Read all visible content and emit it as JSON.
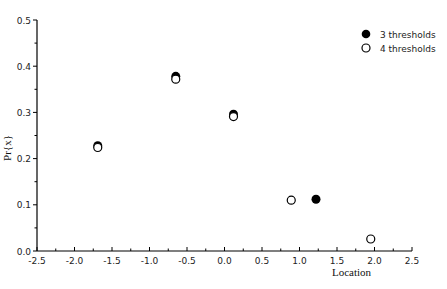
{
  "chart_data": {
    "type": "scatter",
    "title": "",
    "xlabel": "Location",
    "ylabel": "Pr{x}",
    "xlim": [
      -2.5,
      2.5
    ],
    "ylim": [
      0.0,
      0.5
    ],
    "x_ticks": [
      "-2.5",
      "-2.0",
      "-1.5",
      "-1.0",
      "-0.5",
      "0.0",
      "0.5",
      "1.0",
      "1.5",
      "2.0",
      "2.5"
    ],
    "y_ticks": [
      "0.0",
      "0.1",
      "0.2",
      "0.3",
      "0.4",
      "0.5"
    ],
    "grid": false,
    "legend_position": "upper right",
    "series": [
      {
        "name": "3 thresholds",
        "marker": "filled-circle",
        "color": "#000000",
        "points": [
          {
            "x": -1.69,
            "y": 0.228
          },
          {
            "x": -0.65,
            "y": 0.378
          },
          {
            "x": 0.12,
            "y": 0.296
          },
          {
            "x": 1.22,
            "y": 0.112
          }
        ]
      },
      {
        "name": "4 thresholds",
        "marker": "open-circle",
        "color": "#000000",
        "points": [
          {
            "x": -1.69,
            "y": 0.224
          },
          {
            "x": -0.65,
            "y": 0.372
          },
          {
            "x": 0.12,
            "y": 0.291
          },
          {
            "x": 0.89,
            "y": 0.11
          },
          {
            "x": 1.95,
            "y": 0.026
          }
        ]
      }
    ]
  },
  "legend": {
    "items": [
      {
        "label": "3 thresholds",
        "marker": "filled-circle"
      },
      {
        "label": "4 thresholds",
        "marker": "open-circle"
      }
    ]
  }
}
